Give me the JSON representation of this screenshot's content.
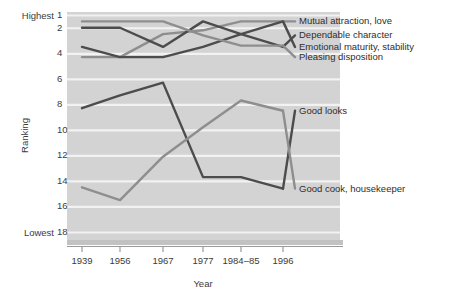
{
  "chart_data": {
    "type": "line",
    "title": "",
    "xlabel": "Year",
    "ylabel": "Ranking",
    "categories": [
      "1939",
      "1956",
      "1967",
      "1977",
      "1984–85",
      "1996"
    ],
    "y_tick_labels": [
      "1",
      "2",
      "4",
      "6",
      "8",
      "10",
      "12",
      "14",
      "16",
      "18"
    ],
    "y_tick_values": [
      1,
      2,
      4,
      6,
      8,
      10,
      12,
      14,
      16,
      18
    ],
    "ylim": [
      1,
      18
    ],
    "y_axis_inverted": true,
    "y_extreme_top_label": "Highest",
    "y_extreme_bottom_label": "Lowest",
    "grid": "horizontal",
    "legend_position": "right-inline",
    "plot_background": "#d3d3d3",
    "gridline_color": "#f2f2f2",
    "colors": {
      "dark": "#4c4c4c",
      "light": "#8e8e8e"
    },
    "series": [
      {
        "name": "Mutual attraction, love",
        "color_key": "light",
        "color": "#8e8e8e",
        "values": [
          4.3,
          4.3,
          2.5,
          2.2,
          1.5,
          1.5
        ],
        "label_y_value": 1.5
      },
      {
        "name": "Dependable character",
        "color_key": "dark",
        "color": "#4c4c4c",
        "values": [
          2.0,
          2.0,
          3.5,
          1.5,
          2.5,
          3.5
        ],
        "label_y_value": 2.6
      },
      {
        "name": "Emotional maturity, stability",
        "color_key": "dark",
        "color": "#4c4c4c",
        "values": [
          3.5,
          4.3,
          4.3,
          3.5,
          2.5,
          1.5
        ],
        "label_y_value": 3.5
      },
      {
        "name": "Pleasing disposition",
        "color_key": "light",
        "color": "#8e8e8e",
        "values": [
          1.5,
          1.5,
          1.5,
          2.6,
          3.4,
          3.4
        ],
        "label_y_value": 4.3
      },
      {
        "name": "Good looks",
        "color_key": "dark",
        "color": "#4c4c4c",
        "values": [
          8.3,
          7.3,
          6.3,
          13.7,
          13.7,
          14.6
        ],
        "label_y_value": 8.5
      },
      {
        "name": "Good cook, housekeeper",
        "color_key": "light",
        "color": "#8e8e8e",
        "values": [
          14.5,
          15.5,
          12.1,
          9.8,
          7.7,
          8.5
        ],
        "label_y_value": 14.6
      }
    ]
  },
  "labels": {
    "series_0": "Mutual attraction, love",
    "series_1": "Dependable character",
    "series_2": "Emotional maturity, stability",
    "series_3": "Pleasing disposition",
    "series_4": "Good looks",
    "series_5": "Good cook, housekeeper"
  }
}
